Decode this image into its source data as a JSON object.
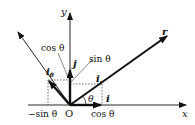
{
  "figure": {
    "type": "polar unit vector decomposition",
    "axes": {
      "x_label": "x",
      "y_label": "y",
      "origin_label": "O"
    },
    "vectors": {
      "r": "r",
      "i": "i",
      "j": "j",
      "i_r": {
        "base": "i",
        "subscript": "r"
      },
      "i_theta": {
        "base": "i",
        "subscript": "θ"
      }
    },
    "angle_label": "θ",
    "component_labels": {
      "cos_x": "cos θ",
      "cos_y": "cos θ",
      "sin_y": "sin θ",
      "neg_sin_x": "−sin θ"
    },
    "colors": {
      "ink": "#111111",
      "background": "#ffffff"
    }
  }
}
